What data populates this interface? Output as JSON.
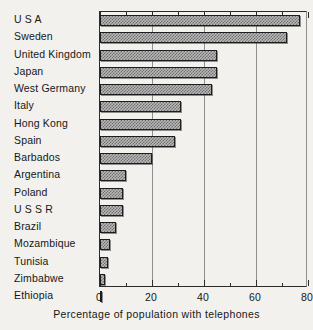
{
  "chart_data": {
    "type": "bar",
    "orientation": "horizontal",
    "title": "",
    "xlabel": "Percentage of population with telephones",
    "ylabel": "",
    "xlim": [
      0,
      80
    ],
    "ylim": null,
    "grid": true,
    "legend": null,
    "xticks": [
      0,
      20,
      40,
      60,
      80
    ],
    "xtick_labels": [
      "0",
      "20",
      "40",
      "60",
      "80"
    ],
    "minor_xticks": [
      10,
      30,
      50,
      70
    ],
    "categories": [
      "U S A",
      "Sweden",
      "United Kingdom",
      "Japan",
      "West Germany",
      "Italy",
      "Hong  Kong",
      "Spain",
      "Barbados",
      "Argentina",
      "Poland",
      "U S S R",
      "Brazil",
      "Mozambique",
      "Tunisia",
      "Zimbabwe",
      "Ethiopia"
    ],
    "values": [
      77,
      72,
      45,
      45,
      43,
      31,
      31,
      29,
      20,
      10,
      9,
      9,
      6,
      4,
      3,
      2,
      0.4
    ],
    "bar_fill": "#b8b8b8",
    "bar_pattern": "checkered-dither",
    "bar_edge_color": "#1d1d1d",
    "axis_color": "#2b2b2b",
    "gridline_color": "#8f8f8f",
    "background_color": "#f2f1ee"
  }
}
